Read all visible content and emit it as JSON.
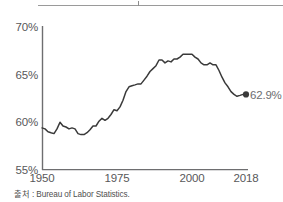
{
  "chart_data": {
    "type": "line",
    "title": "",
    "subtitle": "",
    "xlabel": "",
    "ylabel": "",
    "xlim": [
      1950,
      2018
    ],
    "ylim": [
      55,
      70
    ],
    "xticks": [
      "1950",
      "1975",
      "2000",
      "2018"
    ],
    "xtick_values": [
      1950,
      1975,
      2000,
      2018
    ],
    "yticks": [
      "55%",
      "60%",
      "65%",
      "70%"
    ],
    "ytick_values": [
      55,
      60,
      65,
      70
    ],
    "grid": false,
    "legend": null,
    "line_color": "#3a3a3a",
    "marker_color": "#3a3a3a",
    "end_marker": {
      "x": 2018,
      "y": 62.9,
      "label": "62.9%"
    },
    "series": [
      {
        "name": "Labor force participation rate",
        "x": [
          1950,
          1951,
          1952,
          1953,
          1954,
          1955,
          1956,
          1957,
          1958,
          1959,
          1960,
          1961,
          1962,
          1963,
          1964,
          1965,
          1966,
          1967,
          1968,
          1969,
          1970,
          1971,
          1972,
          1973,
          1974,
          1975,
          1976,
          1977,
          1978,
          1979,
          1980,
          1981,
          1982,
          1983,
          1984,
          1985,
          1986,
          1987,
          1988,
          1989,
          1990,
          1991,
          1992,
          1993,
          1994,
          1995,
          1996,
          1997,
          1998,
          1999,
          2000,
          2001,
          2002,
          2003,
          2004,
          2005,
          2006,
          2007,
          2008,
          2009,
          2010,
          2011,
          2012,
          2013,
          2014,
          2015,
          2016,
          2017,
          2018
        ],
        "values": [
          59.4,
          59.3,
          59.0,
          58.9,
          58.8,
          59.3,
          60.0,
          59.6,
          59.5,
          59.3,
          59.4,
          59.3,
          58.8,
          58.7,
          58.7,
          58.9,
          59.2,
          59.6,
          59.6,
          60.1,
          60.4,
          60.2,
          60.4,
          60.8,
          61.3,
          61.2,
          61.6,
          62.3,
          63.2,
          63.7,
          63.8,
          63.9,
          64.0,
          64.0,
          64.4,
          64.8,
          65.3,
          65.6,
          65.9,
          66.5,
          66.5,
          66.2,
          66.4,
          66.3,
          66.6,
          66.6,
          66.8,
          67.1,
          67.1,
          67.1,
          67.1,
          66.8,
          66.6,
          66.2,
          66.0,
          66.0,
          66.2,
          66.0,
          66.0,
          65.4,
          64.7,
          64.1,
          63.7,
          63.2,
          62.9,
          62.7,
          62.8,
          62.9,
          62.9
        ]
      }
    ],
    "source_note": "출처 : Bureau of Labor Statistics."
  },
  "axis": {
    "y_labels": [
      "70%",
      "65%",
      "60%",
      "55%"
    ],
    "x_labels": [
      "1950",
      "1975",
      "2000",
      "2018"
    ]
  },
  "annotation": {
    "end_value_label": "62.9%"
  },
  "footer": {
    "source": "출처 : Bureau of Labor Statistics."
  }
}
